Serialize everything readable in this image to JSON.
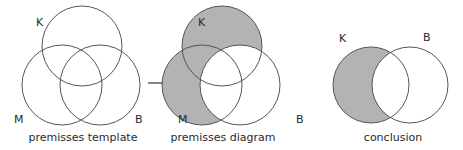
{
  "colors": {
    "shade": "#b3b3b3",
    "stroke": "#555555",
    "text": "#2a2a2a"
  },
  "diagrams": [
    {
      "caption": "premisses template",
      "labels": {
        "K": "K",
        "M": "M",
        "B": "B"
      },
      "shaded_regions": []
    },
    {
      "caption": "premisses diagram",
      "labels": {
        "K": "K",
        "M": "M",
        "B": "B"
      },
      "shaded_regions": [
        "K only",
        "M only",
        "K and M not B"
      ]
    },
    {
      "caption": "conclusion",
      "labels": {
        "K": "K",
        "B": "B"
      },
      "shaded_regions": [
        "K not B"
      ]
    }
  ],
  "arrow": {
    "direction": "right"
  }
}
